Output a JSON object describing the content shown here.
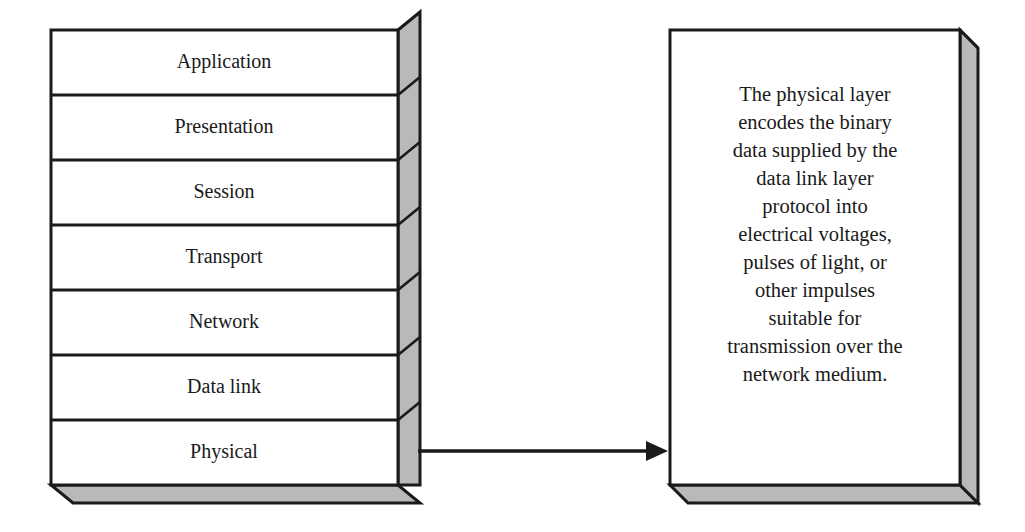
{
  "figure": {
    "background_color": "#ffffff",
    "line_color": "#1a1a1a",
    "shade_color": "#b9b9b9"
  },
  "stack": {
    "name": "osi-layer-stack",
    "layers": [
      {
        "label": "Application"
      },
      {
        "label": "Presentation"
      },
      {
        "label": "Session"
      },
      {
        "label": "Transport"
      },
      {
        "label": "Network"
      },
      {
        "label": "Data link"
      },
      {
        "label": "Physical"
      }
    ]
  },
  "connector": {
    "name": "arrow-physical-to-description",
    "from_layer": "Physical",
    "to": "description-box",
    "style": "solid-arrow-right"
  },
  "description_box": {
    "name": "physical-layer-description",
    "text": "The physical layer encodes the binary data supplied by the data link layer protocol into electrical voltages, pulses of light, or other impulses suitable for transmission over the network medium.",
    "lines": [
      "The physical layer",
      "encodes the binary",
      "data supplied by the",
      "data link layer",
      "protocol into",
      "electrical voltages,",
      "pulses of light, or",
      "other impulses",
      "suitable for",
      "transmission over the",
      "network medium."
    ]
  }
}
